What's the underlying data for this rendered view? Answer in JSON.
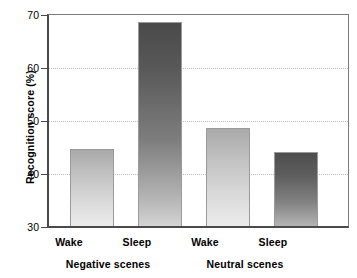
{
  "chart_data": {
    "type": "bar",
    "title": "",
    "xlabel": "",
    "ylabel": "Recognition score (%)",
    "ylim": [
      30,
      70
    ],
    "yticks": [
      30,
      40,
      50,
      60,
      70
    ],
    "ytick_labels": [
      "30",
      "40",
      "50",
      "60",
      "70"
    ],
    "grid": true,
    "gridlines_at": [
      40,
      50,
      60
    ],
    "legend": "none",
    "categories": [
      "Wake",
      "Sleep",
      "Wake",
      "Sleep"
    ],
    "values": [
      44.5,
      68.5,
      48.5,
      44.0
    ],
    "groups": [
      {
        "label": "Negative scenes",
        "categories": [
          "Wake",
          "Sleep"
        ],
        "values": [
          44.5,
          68.5
        ]
      },
      {
        "label": "Neutral scenes",
        "categories": [
          "Wake",
          "Sleep"
        ],
        "values": [
          48.5,
          44.0
        ]
      }
    ],
    "bars": [
      {
        "label": "Wake",
        "group": "Negative scenes",
        "value": 44.5,
        "shade": "light"
      },
      {
        "label": "Sleep",
        "group": "Negative scenes",
        "value": 68.5,
        "shade": "dark"
      },
      {
        "label": "Wake",
        "group": "Neutral scenes",
        "value": 48.5,
        "shade": "light"
      },
      {
        "label": "Sleep",
        "group": "Neutral scenes",
        "value": 44.0,
        "shade": "darkshort"
      }
    ]
  },
  "axis": {
    "y_title": "Recognition score (%)",
    "tick_70": "70",
    "tick_60": "60",
    "tick_50": "50",
    "tick_40": "40",
    "tick_30": "30"
  },
  "xlabels": {
    "bar1": "Wake",
    "bar2": "Sleep",
    "bar3": "Wake",
    "bar4": "Sleep"
  },
  "grouplabels": {
    "left": "Negative scenes",
    "right": "Neutral scenes"
  },
  "colors": {
    "axis": "#4a4a4a",
    "frame": "#7b7b7b",
    "grid": "#bdbdbd",
    "bar_light_top": "#a9a9a9",
    "bar_light_bottom": "#ececec",
    "bar_dark_top": "#4a4a4a",
    "bar_dark_bottom": "#d4d4d4",
    "text": "#000000",
    "background": "#ffffff"
  }
}
